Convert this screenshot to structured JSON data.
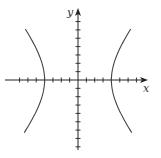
{
  "chart_data": {
    "type": "line",
    "title": "",
    "equation": "x^2/16 - y^2/25 = 1",
    "xlabel": "x",
    "ylabel": "y",
    "xlim": [
      -7,
      8
    ],
    "ylim": [
      -8,
      8.5
    ],
    "tick_spacing": 1,
    "tick_labels": false,
    "grid": false,
    "legend": null,
    "series": [
      {
        "name": "left-branch",
        "x": [
          -6.3,
          -5.5,
          -4.8,
          -4.3,
          -4.0,
          -4.3,
          -4.8,
          -5.5,
          -6.3
        ],
        "y": [
          6.1,
          4.6,
          3.3,
          1.9,
          0,
          -1.9,
          -3.3,
          -4.6,
          -6.3
        ]
      },
      {
        "name": "right-branch",
        "x": [
          6.3,
          5.5,
          4.8,
          4.3,
          4.0,
          4.3,
          4.8,
          5.5,
          6.3
        ],
        "y": [
          6.1,
          4.6,
          3.3,
          1.9,
          0,
          -1.9,
          -3.3,
          -4.6,
          -6.3
        ]
      }
    ],
    "vertices": [
      [
        -4,
        0
      ],
      [
        4,
        0
      ]
    ]
  },
  "layout": {
    "origin_px": [
      78,
      80
    ],
    "unit_px": 8.35,
    "x_axis": {
      "from_px": 5,
      "to_px": 148
    },
    "y_axis": {
      "from_px": 150,
      "to_px": 8
    },
    "x_ticks": [
      -7,
      -6,
      -5,
      -4,
      -3,
      -2,
      -1,
      1,
      2,
      3,
      4,
      5,
      6,
      7
    ],
    "y_ticks": [
      -8,
      -7,
      -6,
      -5,
      -4,
      -3,
      -2,
      -1,
      1,
      2,
      3,
      4,
      5,
      6,
      7
    ],
    "curve_y_range": [
      -6.3,
      6.1
    ],
    "a": 4,
    "b": 5,
    "colors": {
      "axis": "#222222",
      "curve": "#444444"
    }
  }
}
